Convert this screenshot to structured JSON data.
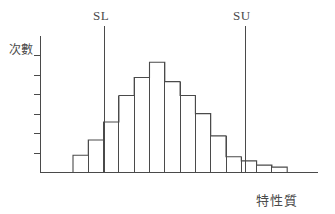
{
  "figure": {
    "kind": "histogram-with-spec-limits",
    "background_color": "#ffffff",
    "line_color": "#4a4a4a"
  },
  "labels": {
    "y_axis": "次數",
    "x_axis": "特性質",
    "spec_lower": "SL",
    "spec_upper": "SU"
  },
  "chart_data": {
    "type": "bar",
    "title": "",
    "xlabel": "特性質",
    "ylabel": "次數",
    "grid": false,
    "legend": null,
    "xlim": [
      0,
      15
    ],
    "ylim": [
      0,
      12
    ],
    "axis_ticks_y": [
      1,
      2,
      3,
      4,
      5,
      6
    ],
    "categories": [
      "1",
      "2",
      "3",
      "4",
      "5",
      "6",
      "7",
      "8",
      "9",
      "10",
      "11",
      "12",
      "13",
      "14"
    ],
    "values": [
      1.2,
      2.3,
      3.6,
      5.5,
      6.8,
      7.9,
      6.5,
      5.5,
      4.2,
      2.6,
      1.1,
      0.8,
      0.5,
      0.35
    ],
    "annotations": [
      {
        "label": "SL",
        "type": "vline",
        "x_index": 2.1
      },
      {
        "label": "SU",
        "type": "vline",
        "x_index": 11.5
      }
    ]
  },
  "geometry": {
    "baseline_y": 172,
    "axis_left_x": 40,
    "axis_right_x": 318,
    "axis_top_y": 36,
    "bar_start_x": 73,
    "bar_width": 15.3,
    "value_scale": 13.9,
    "sl_x": 104,
    "su_x": 245,
    "spec_line_top_y": 26,
    "y_tick_len": 7,
    "y_tick_spacing": 19.5
  }
}
